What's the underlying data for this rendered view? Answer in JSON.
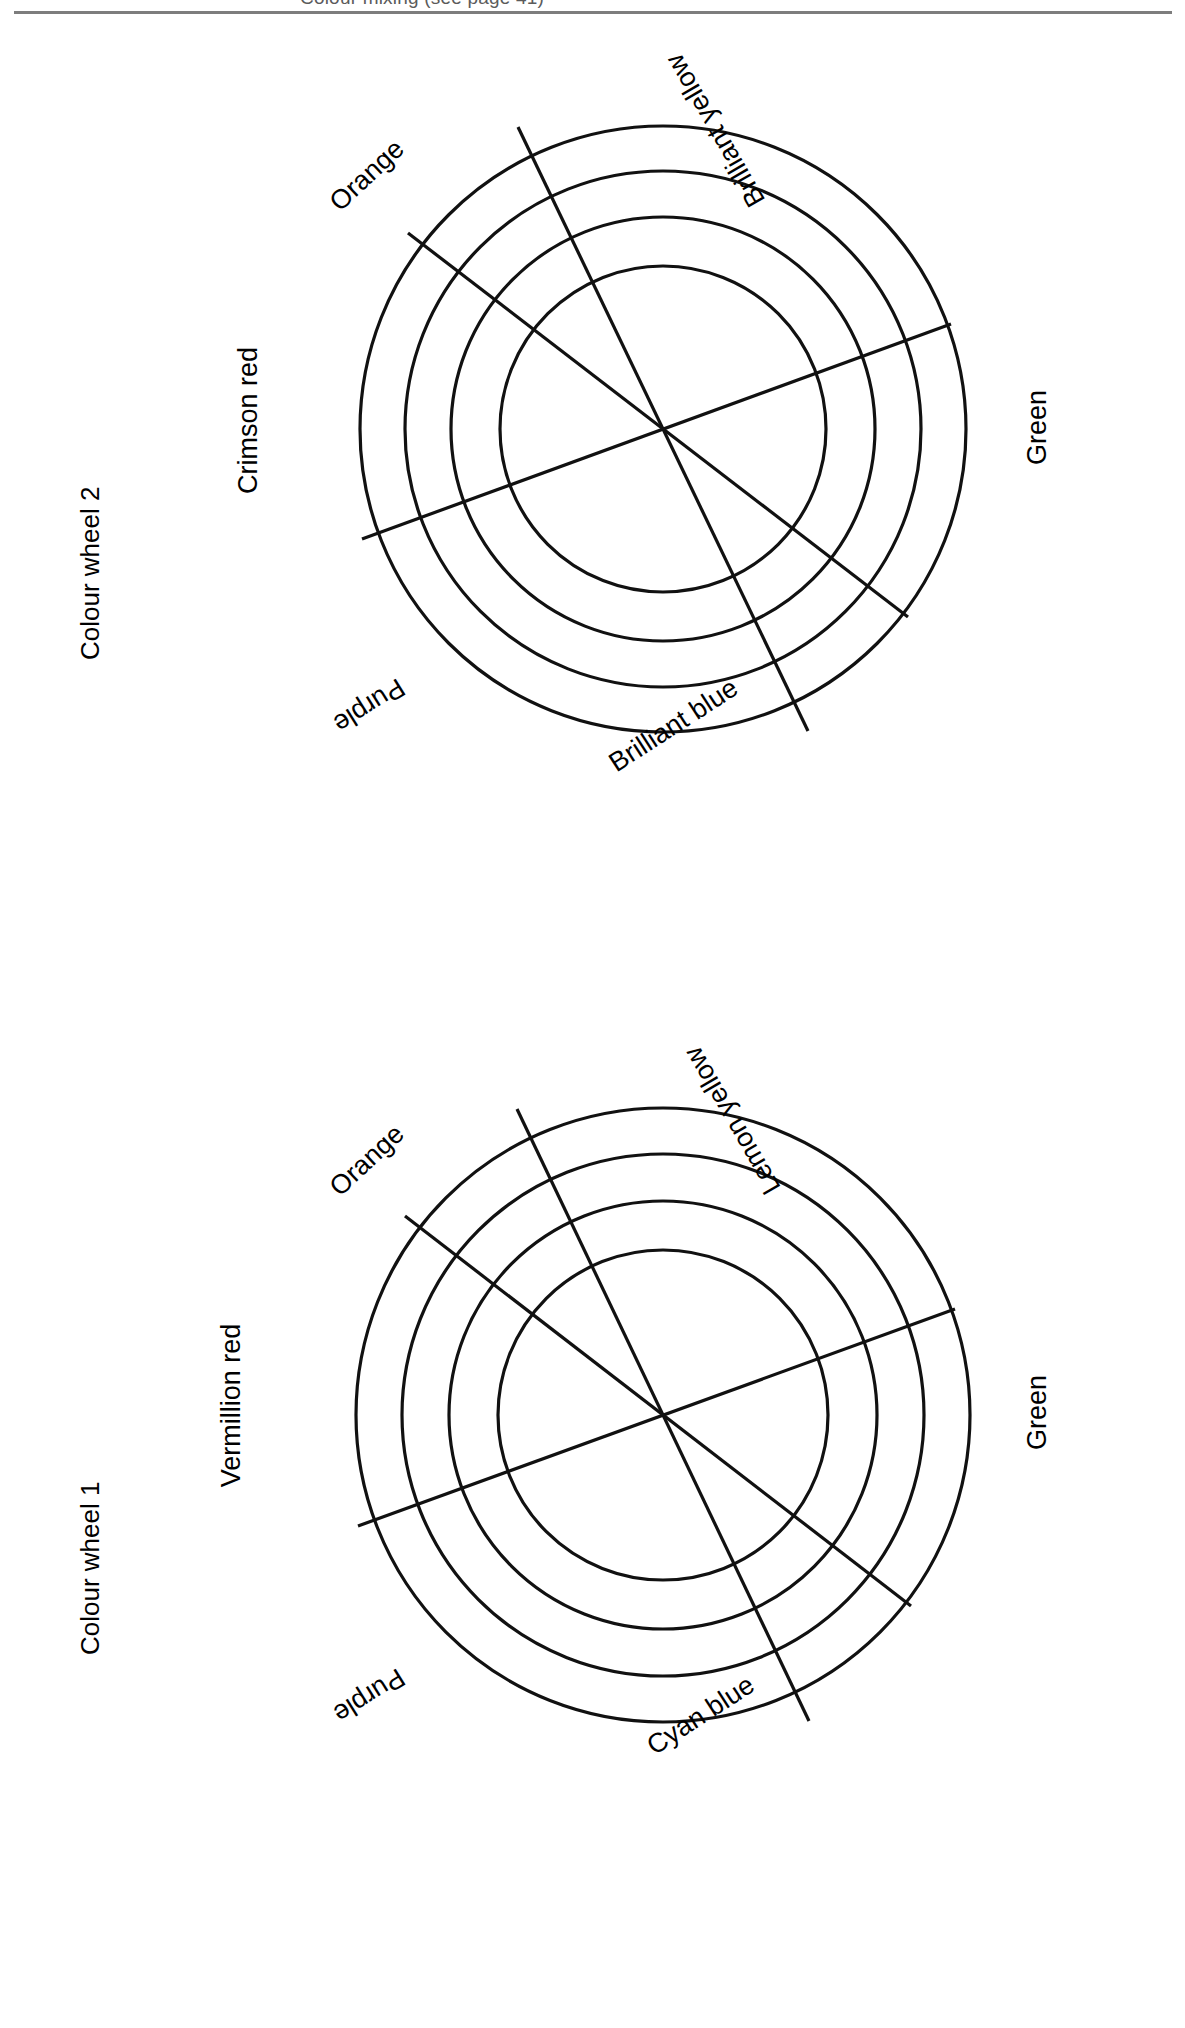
{
  "page": {
    "background": "#ffffff",
    "ink": "#111111",
    "rule_color": "#7d7d7d",
    "clipped_header_text": "Colour mixing (see page 41)"
  },
  "wheels": [
    {
      "id": "colour-wheel-2",
      "title": "Colour wheel 2",
      "rings": 4,
      "sectors": 6,
      "labels": [
        {
          "name": "orange",
          "text": "Orange"
        },
        {
          "name": "brilliant-yellow",
          "text": "Brilliant yellow"
        },
        {
          "name": "green",
          "text": "Green"
        },
        {
          "name": "brilliant-blue",
          "text": "Brilliant blue"
        },
        {
          "name": "purple",
          "text": "Purple"
        },
        {
          "name": "crimson-red",
          "text": "Crimson red"
        }
      ]
    },
    {
      "id": "colour-wheel-1",
      "title": "Colour wheel 1",
      "rings": 4,
      "sectors": 6,
      "labels": [
        {
          "name": "orange",
          "text": "Orange"
        },
        {
          "name": "lemon-yellow",
          "text": "Lemon yellow"
        },
        {
          "name": "green",
          "text": "Green"
        },
        {
          "name": "cyan-blue",
          "text": "Cyan blue"
        },
        {
          "name": "purple",
          "text": "Purple"
        },
        {
          "name": "vermillion-red",
          "text": "Vermillion red"
        }
      ]
    }
  ]
}
